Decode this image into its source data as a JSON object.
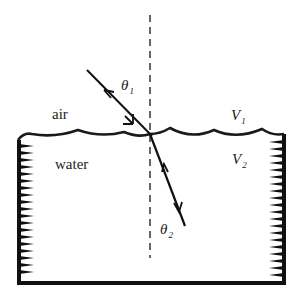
{
  "diagram": {
    "media": {
      "upper": {
        "label": "air",
        "velocity_symbol": "V",
        "velocity_subscript": "1"
      },
      "lower": {
        "label": "water",
        "velocity_symbol": "V",
        "velocity_subscript": "2"
      }
    },
    "angles": {
      "incident": {
        "symbol": "θ",
        "subscript": "1"
      },
      "refracted": {
        "symbol": "θ",
        "subscript": "2"
      }
    },
    "elements": [
      "wavy water surface",
      "dashed normal line",
      "incident ray with arrows",
      "refracted ray with arrows",
      "container walls with hatching"
    ],
    "colors": {
      "ink": "#1a1a1a",
      "background": "#ffffff"
    }
  }
}
